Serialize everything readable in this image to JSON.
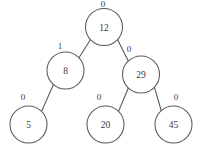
{
  "diagram": {
    "type": "binary-tree",
    "canvas": {
      "width": 198,
      "height": 158
    },
    "style": {
      "stroke_color": "#5a5a58",
      "text_color": "#3a3a38",
      "node_fill": "#ffffff",
      "background": "#ffffff",
      "watermark_color": "#cfcfd4"
    },
    "watermark": {
      "text": "",
      "x": 45,
      "y": 47,
      "visible": false
    },
    "nodes": [
      {
        "id": "n12",
        "value": "12",
        "cx": 104,
        "cy": 27,
        "r": 18.5,
        "balance_label": "0",
        "label_x": 103,
        "label_y": 4
      },
      {
        "id": "n8",
        "value": "8",
        "cx": 65.5,
        "cy": 70.5,
        "r": 18.5,
        "balance_label": "1",
        "label_x": 60,
        "label_y": 46
      },
      {
        "id": "n29",
        "value": "29",
        "cx": 141,
        "cy": 74.5,
        "r": 18.5,
        "balance_label": "0",
        "label_x": 129,
        "label_y": 49
      },
      {
        "id": "n5",
        "value": "5",
        "cx": 28.5,
        "cy": 124.5,
        "r": 18.5,
        "balance_label": "0",
        "label_x": 23,
        "label_y": 97
      },
      {
        "id": "n20",
        "value": "20",
        "cx": 105.5,
        "cy": 124.5,
        "r": 18.5,
        "balance_label": "0",
        "label_x": 99,
        "label_y": 97
      },
      {
        "id": "n45",
        "value": "45",
        "cx": 173.5,
        "cy": 124.5,
        "r": 18.5,
        "balance_label": "0",
        "label_x": 176,
        "label_y": 97
      }
    ],
    "edges": [
      {
        "id": "e-12-8",
        "from": "n12",
        "to": "n8",
        "x1": 90.5,
        "y1": 39.5,
        "x2": 78.5,
        "y2": 58.5
      },
      {
        "id": "e-12-29",
        "from": "n12",
        "to": "n29",
        "x1": 117.5,
        "y1": 39.5,
        "x2": 128.5,
        "y2": 61.5
      },
      {
        "id": "e-8-5",
        "from": "n8",
        "to": "n5",
        "x1": 53.5,
        "y1": 84.5,
        "x2": 41.5,
        "y2": 111.5
      },
      {
        "id": "e-29-20",
        "from": "n29",
        "to": "n20",
        "x1": 128.5,
        "y1": 87.5,
        "x2": 118.5,
        "y2": 111.5
      },
      {
        "id": "e-29-45",
        "from": "n29",
        "to": "n45",
        "x1": 154.5,
        "y1": 87.5,
        "x2": 161.5,
        "y2": 111.5
      }
    ]
  }
}
